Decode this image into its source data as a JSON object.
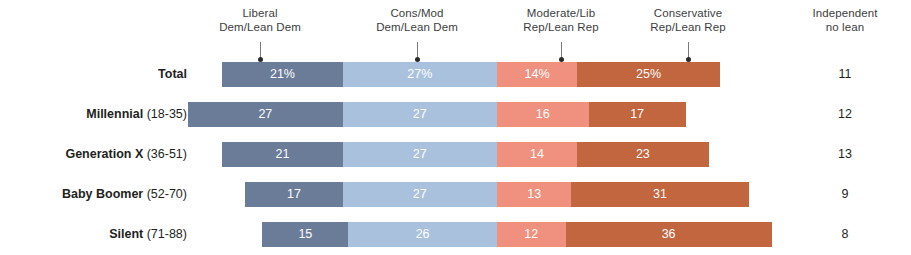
{
  "headers": [
    {
      "line1": "Liberal",
      "line2": "Dem/Lean Dem",
      "center_x": 260
    },
    {
      "line1": "Cons/Mod",
      "line2": "Dem/Lean Dem",
      "center_x": 417
    },
    {
      "line1": "Moderate/Lib",
      "line2": "Rep/Lean Rep",
      "center_x": 561
    },
    {
      "line1": "Conservative",
      "line2": "Rep/Lean Rep",
      "center_x": 688
    },
    {
      "line1": "Independent",
      "line2": "no lean",
      "center_x": 845
    }
  ],
  "rows": [
    {
      "label": "Total",
      "age": "",
      "bold_label": true,
      "independent": "11"
    },
    {
      "label": "Millennial",
      "age": " (18-35)",
      "bold_label": true,
      "independent": "12"
    },
    {
      "label": "Generation X",
      "age": " (36-51)",
      "bold_label": true,
      "independent": "13"
    },
    {
      "label": "Baby Boomer",
      "age": " (52-70)",
      "bold_label": true,
      "independent": "9"
    },
    {
      "label": "Silent",
      "age": " (71-88)",
      "bold_label": true,
      "independent": "8"
    }
  ],
  "colors": {
    "liberal_dem": "#6b7c99",
    "cons_mod_dem": "#aac1dd",
    "moderate_rep": "#f0907e",
    "conservative_rep": "#c1663f",
    "text": "#231f20"
  },
  "chart_data": {
    "type": "bar",
    "title": "",
    "subtitle": "",
    "orientation": "horizontal",
    "stacked": true,
    "diverging": true,
    "center_axis_label": "Democrat / Republican split",
    "categories": [
      "Total",
      "Millennial (18-35)",
      "Generation X (36-51)",
      "Baby Boomer (52-70)",
      "Silent (71-88)"
    ],
    "series": [
      {
        "name": "Liberal Dem/Lean Dem",
        "side": "left",
        "color": "#6b7c99",
        "values": [
          21,
          27,
          21,
          17,
          15
        ],
        "labels": [
          "21%",
          "27",
          "21",
          "17",
          "15"
        ]
      },
      {
        "name": "Cons/Mod Dem/Lean Dem",
        "side": "left",
        "color": "#aac1dd",
        "values": [
          27,
          27,
          27,
          27,
          26
        ],
        "labels": [
          "27%",
          "27",
          "27",
          "27",
          "26"
        ]
      },
      {
        "name": "Moderate/Lib Rep/Lean Rep",
        "side": "right",
        "color": "#f0907e",
        "values": [
          14,
          16,
          14,
          13,
          12
        ],
        "labels": [
          "14%",
          "16",
          "14",
          "13",
          "12"
        ]
      },
      {
        "name": "Conservative Rep/Lean Rep",
        "side": "right",
        "color": "#c1663f",
        "values": [
          25,
          17,
          23,
          31,
          36
        ],
        "labels": [
          "25%",
          "17",
          "23",
          "31",
          "36"
        ]
      }
    ],
    "extra_column": {
      "name": "Independent no lean",
      "values": [
        11,
        12,
        13,
        9,
        8
      ],
      "labels": [
        "11",
        "12",
        "13",
        "9",
        "8"
      ]
    },
    "xlabel": "",
    "ylabel": "",
    "grid": false,
    "legend": "column-headers-with-pointers"
  }
}
